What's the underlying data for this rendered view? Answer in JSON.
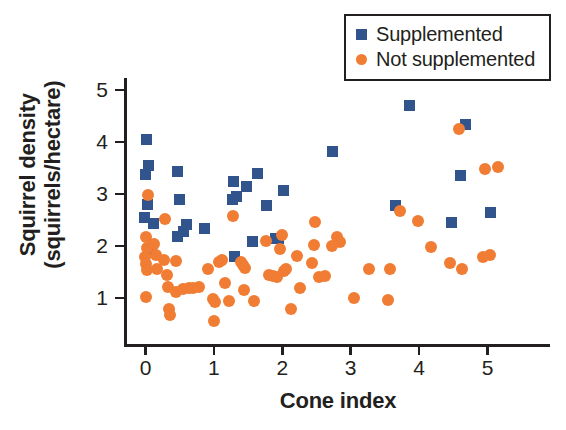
{
  "chart_data": {
    "type": "scatter",
    "title": "",
    "xlabel": "Cone index",
    "ylabel": "Squirrel density (squirrels/hectare)",
    "ylabel_line1": "Squirrel density",
    "ylabel_line2": "(squirrels/hectare)",
    "xlim": [
      -0.32,
      5.55
    ],
    "ylim": [
      0.32,
      5.28
    ],
    "xticks": [
      0,
      1,
      2,
      3,
      4,
      5
    ],
    "yticks": [
      1,
      2,
      3,
      4,
      5
    ],
    "xticklabels": [
      "0",
      "1",
      "2",
      "3",
      "4",
      "5"
    ],
    "yticklabels": [
      "1",
      "2",
      "3",
      "4",
      "5"
    ],
    "grid": false,
    "legend_position": "top-right",
    "colors": {
      "supplemented": "#32548C",
      "not_supplemented": "#F07D33",
      "axis": "#231f20",
      "background": "#ffffff"
    },
    "series": [
      {
        "name": "Supplemented",
        "marker": "square",
        "color": "#32548C",
        "points": [
          [
            0.02,
            4.04
          ],
          [
            0.04,
            3.55
          ],
          [
            0.0,
            3.37
          ],
          [
            0.03,
            2.79
          ],
          [
            -0.02,
            2.54
          ],
          [
            0.12,
            2.43
          ],
          [
            0.07,
            1.88
          ],
          [
            0.47,
            3.44
          ],
          [
            0.49,
            2.89
          ],
          [
            0.47,
            2.19
          ],
          [
            0.55,
            2.28
          ],
          [
            0.6,
            2.42
          ],
          [
            0.86,
            2.34
          ],
          [
            1.29,
            3.25
          ],
          [
            1.27,
            2.89
          ],
          [
            1.33,
            2.96
          ],
          [
            1.48,
            3.14
          ],
          [
            1.3,
            1.8
          ],
          [
            1.57,
            2.09
          ],
          [
            1.77,
            2.78
          ],
          [
            1.64,
            3.39
          ],
          [
            1.9,
            2.14
          ],
          [
            1.95,
            2.15
          ],
          [
            2.02,
            3.06
          ],
          [
            2.74,
            3.81
          ],
          [
            3.66,
            2.77
          ],
          [
            3.86,
            4.7
          ],
          [
            4.47,
            2.46
          ],
          [
            4.6,
            3.35
          ],
          [
            4.68,
            4.33
          ],
          [
            5.05,
            2.65
          ]
        ]
      },
      {
        "name": "Not supplemented",
        "marker": "circle",
        "color": "#F07D33",
        "points": [
          [
            0.03,
            2.99
          ],
          [
            0.0,
            2.18
          ],
          [
            0.02,
            1.96
          ],
          [
            -0.01,
            1.79
          ],
          [
            0.01,
            1.65
          ],
          [
            0.02,
            1.53
          ],
          [
            0.0,
            1.02
          ],
          [
            0.13,
            2.03
          ],
          [
            0.15,
            1.82
          ],
          [
            0.17,
            1.56
          ],
          [
            0.29,
            2.51
          ],
          [
            0.27,
            1.74
          ],
          [
            0.31,
            1.45
          ],
          [
            0.33,
            1.21
          ],
          [
            0.35,
            0.78
          ],
          [
            0.36,
            0.68
          ],
          [
            0.44,
            1.72
          ],
          [
            0.45,
            1.12
          ],
          [
            0.55,
            1.18
          ],
          [
            0.64,
            1.19
          ],
          [
            0.7,
            1.2
          ],
          [
            0.78,
            1.22
          ],
          [
            0.92,
            1.56
          ],
          [
            0.99,
            0.99
          ],
          [
            1.01,
            0.92
          ],
          [
            1.0,
            0.56
          ],
          [
            1.07,
            1.7
          ],
          [
            1.12,
            1.73
          ],
          [
            1.16,
            1.29
          ],
          [
            1.22,
            0.95
          ],
          [
            1.28,
            2.57
          ],
          [
            1.4,
            1.7
          ],
          [
            1.42,
            1.64
          ],
          [
            1.46,
            1.58
          ],
          [
            1.44,
            1.15
          ],
          [
            1.58,
            0.95
          ],
          [
            1.76,
            2.1
          ],
          [
            1.8,
            1.44
          ],
          [
            1.86,
            1.42
          ],
          [
            1.92,
            1.4
          ],
          [
            1.97,
            1.94
          ],
          [
            2.0,
            2.21
          ],
          [
            2.02,
            1.52
          ],
          [
            2.05,
            1.56
          ],
          [
            2.12,
            0.79
          ],
          [
            2.21,
            1.8
          ],
          [
            2.26,
            1.19
          ],
          [
            2.43,
            1.67
          ],
          [
            2.48,
            2.46
          ],
          [
            2.47,
            2.02
          ],
          [
            2.54,
            1.41
          ],
          [
            2.62,
            1.42
          ],
          [
            2.72,
            2.0
          ],
          [
            2.8,
            2.17
          ],
          [
            2.84,
            2.07
          ],
          [
            3.05,
            1.0
          ],
          [
            3.27,
            1.56
          ],
          [
            3.54,
            0.97
          ],
          [
            3.58,
            1.56
          ],
          [
            3.72,
            2.68
          ],
          [
            3.98,
            2.48
          ],
          [
            4.18,
            1.98
          ],
          [
            4.45,
            1.68
          ],
          [
            4.58,
            4.25
          ],
          [
            4.63,
            1.56
          ],
          [
            4.93,
            1.79
          ],
          [
            4.96,
            3.48
          ],
          [
            5.04,
            1.83
          ],
          [
            5.16,
            3.51
          ]
        ]
      }
    ]
  },
  "legend": {
    "items": [
      {
        "label": "Supplemented",
        "marker": "square",
        "color": "#32548C"
      },
      {
        "label": "Not supplemented",
        "marker": "circle",
        "color": "#F07D33"
      }
    ]
  }
}
